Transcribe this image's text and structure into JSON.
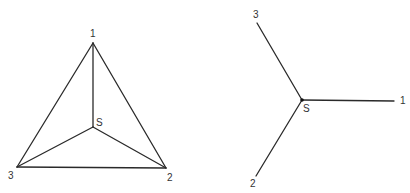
{
  "left_figure": {
    "description": "Triangle with vertices 1, 2, 3 and interior point S joined to each vertex",
    "points": {
      "1": {
        "x": 93,
        "y": 43,
        "label": "1",
        "lx": 90,
        "ly": 37
      },
      "2": {
        "x": 166,
        "y": 168,
        "label": "2",
        "lx": 167,
        "ly": 181
      },
      "3": {
        "x": 17,
        "y": 167,
        "label": "3",
        "lx": 8,
        "ly": 179
      },
      "S": {
        "x": 93,
        "y": 127,
        "label": "S",
        "lx": 96,
        "ly": 126
      }
    }
  },
  "right_figure": {
    "description": "Star graph with center S connected to 1, 2, 3",
    "points": {
      "1": {
        "x": 394,
        "y": 101,
        "label": "1",
        "lx": 400,
        "ly": 104
      },
      "2": {
        "x": 256,
        "y": 176,
        "label": "2",
        "lx": 250,
        "ly": 187
      },
      "3": {
        "x": 257,
        "y": 23,
        "label": "3",
        "lx": 253,
        "ly": 18
      },
      "S": {
        "x": 302,
        "y": 100,
        "label": "S",
        "lx": 303,
        "ly": 112
      }
    }
  }
}
